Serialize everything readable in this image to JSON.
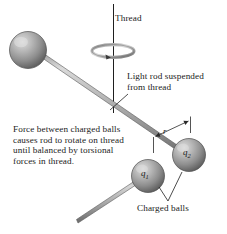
{
  "figure": {
    "background_color": "#ffffff",
    "width": 227,
    "height": 234
  },
  "labels": {
    "thread": "Thread",
    "light_rod": "Light rod suspended\nfrom thread",
    "force_note": "Force between charged balls\ncauses rod to rotate on thread\nuntil balanced by torsional\nforces in thread.",
    "charged_balls": "Charged balls",
    "charge_1": "q",
    "charge_1_sub": "1",
    "charge_2": "q",
    "charge_2_sub": "2",
    "separation": "r"
  },
  "colors": {
    "text": "#1b1b1b",
    "line": "#2b2b2b",
    "rod_light": "#d2d2d2",
    "rod_dark": "#8a8a8a",
    "sphere_highlight": "#d8d8d8",
    "sphere_mid": "#9a9a9a",
    "sphere_shadow": "#5c5c5c"
  },
  "elements": {
    "thread_line": "vertical-thread",
    "torsion_ellipse": "rotation-indicator",
    "ball_left": "uncharged-ball-left",
    "ball_q1": "charged-ball-q1",
    "ball_q2": "charged-ball-q2",
    "rod_main": "light-rod-horizontal",
    "rod_lower": "light-rod-lower",
    "dimension_r": "separation-dimension-arrow",
    "leader_light_rod": "leader-line-light-rod",
    "leader_charged_balls": "leader-line-charged-balls"
  }
}
